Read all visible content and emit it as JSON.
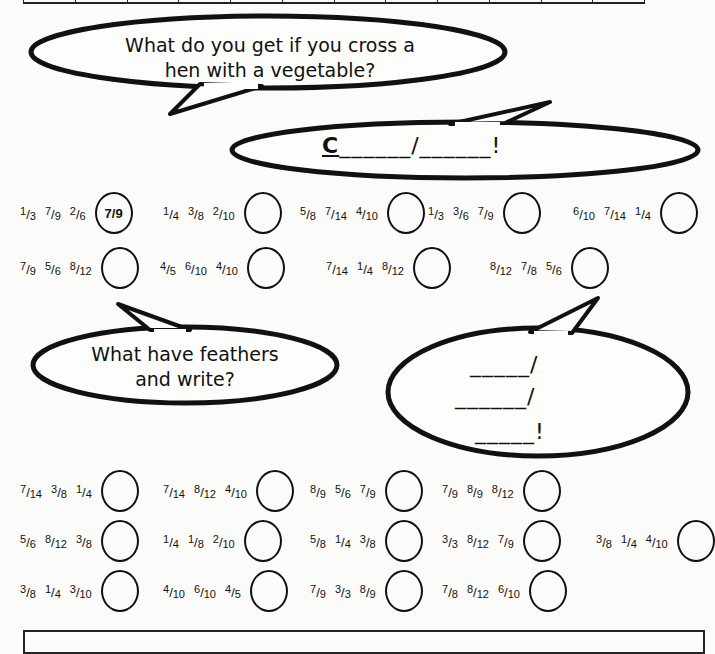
{
  "bubbles": {
    "question1": "What do you get if you cross a hen with a vegetable?",
    "answer1": "C______/______!",
    "answer1_first_letter": "C",
    "question2": "What have feathers and write?",
    "answer2_lines": [
      "_____/",
      "______/",
      "_____!"
    ]
  },
  "puzzle1": {
    "rows": [
      [
        {
          "fractions": [
            "1/3",
            "7/9",
            "2/6"
          ],
          "answer": "7/9"
        },
        {
          "fractions": [
            "1/4",
            "3/8",
            "2/10"
          ],
          "answer": ""
        },
        {
          "fractions": [
            "5/8",
            "7/14",
            "4/10"
          ],
          "answer": ""
        },
        {
          "fractions": [
            "1/3",
            "3/6",
            "7/9"
          ],
          "answer": ""
        },
        {
          "fractions": [
            "6/10",
            "7/14",
            "1/4"
          ],
          "answer": ""
        }
      ],
      [
        {
          "fractions": [
            "7/9",
            "5/6",
            "8/12"
          ],
          "answer": ""
        },
        {
          "fractions": [
            "4/5",
            "6/10",
            "4/10"
          ],
          "answer": ""
        },
        {
          "fractions": [
            "7/14",
            "1/4",
            "8/12"
          ],
          "answer": ""
        },
        {
          "fractions": [
            "8/12",
            "7/8",
            "5/6"
          ],
          "answer": ""
        }
      ]
    ]
  },
  "puzzle2": {
    "rows": [
      [
        {
          "fractions": [
            "7/14",
            "3/8",
            "1/4"
          ],
          "answer": ""
        },
        {
          "fractions": [
            "7/14",
            "8/12",
            "4/10"
          ],
          "answer": ""
        },
        {
          "fractions": [
            "8/9",
            "5/6",
            "7/9"
          ],
          "answer": ""
        },
        {
          "fractions": [
            "7/9",
            "8/9",
            "8/12"
          ],
          "answer": ""
        }
      ],
      [
        {
          "fractions": [
            "5/6",
            "8/12",
            "3/8"
          ],
          "answer": ""
        },
        {
          "fractions": [
            "1/4",
            "1/8",
            "2/10"
          ],
          "answer": ""
        },
        {
          "fractions": [
            "5/8",
            "1/4",
            "3/8"
          ],
          "answer": ""
        },
        {
          "fractions": [
            "3/3",
            "8/12",
            "7/9"
          ],
          "answer": ""
        },
        {
          "fractions": [
            "3/8",
            "1/4",
            "4/10"
          ],
          "answer": ""
        }
      ],
      [
        {
          "fractions": [
            "3/8",
            "1/4",
            "3/10"
          ],
          "answer": ""
        },
        {
          "fractions": [
            "4/10",
            "6/10",
            "4/5"
          ],
          "answer": ""
        },
        {
          "fractions": [
            "7/9",
            "3/3",
            "8/9"
          ],
          "answer": ""
        },
        {
          "fractions": [
            "7/8",
            "8/12",
            "6/10"
          ],
          "answer": ""
        }
      ]
    ]
  }
}
